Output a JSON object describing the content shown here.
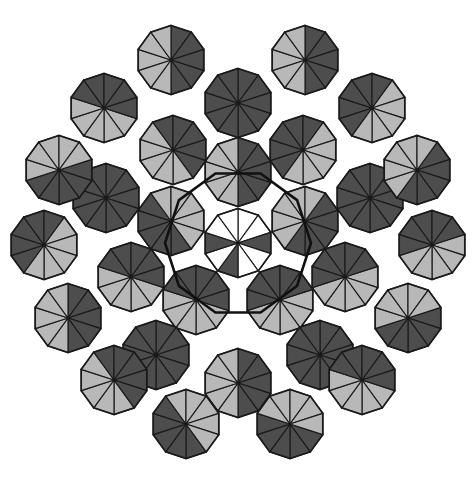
{
  "figure": {
    "caption": "",
    "width": 476,
    "height": 482,
    "background_color": "#ffffff"
  },
  "palette": {
    "dark": "#4d4d4d",
    "light": "#b8b8b8",
    "white": "#ffffff",
    "stroke": "#1a1a1a",
    "heavy_stroke": "#111111"
  },
  "geometry": {
    "center_x": 238,
    "center_y": 243,
    "decagon_radius": 34.5,
    "symmetry_order": 10,
    "stroke_width": 1.15,
    "heavy_stroke_width": 2.6,
    "pattern_bounds": {
      "left": 14,
      "top": 22,
      "right": 462,
      "bottom": 466
    },
    "central_hub_radius": 73
  },
  "chart_data": {
    "type": "scatter",
    "xlabel": "",
    "ylabel": "",
    "decagons": [
      {
        "cx": 238,
        "cy": 243,
        "ring": 0,
        "pattern": "center",
        "rot": 0
      },
      {
        "cx": 238,
        "cy": 172,
        "ring": 1,
        "pattern": "halfDarkTop",
        "rot": 0
      },
      {
        "cx": 305,
        "cy": 221,
        "ring": 1,
        "pattern": "halfDarkTop",
        "rot": 36
      },
      {
        "cx": 280,
        "cy": 300,
        "ring": 1,
        "pattern": "halfLightTop",
        "rot": 72
      },
      {
        "cx": 196,
        "cy": 300,
        "ring": 1,
        "pattern": "halfLightTop",
        "rot": 108
      },
      {
        "cx": 171,
        "cy": 221,
        "ring": 1,
        "pattern": "halfDarkTop",
        "rot": 144
      },
      {
        "cx": 238,
        "cy": 103,
        "ring": 2,
        "pattern": "allDark",
        "rot": 0
      },
      {
        "cx": 303,
        "cy": 150,
        "ring": 2,
        "pattern": "halfLightTop",
        "rot": 36
      },
      {
        "cx": 370,
        "cy": 198,
        "ring": 2,
        "pattern": "allDark",
        "rot": 0
      },
      {
        "cx": 345,
        "cy": 277,
        "ring": 2,
        "pattern": "halfLightTop",
        "rot": 72
      },
      {
        "cx": 320,
        "cy": 355,
        "ring": 2,
        "pattern": "allDark",
        "rot": 0
      },
      {
        "cx": 238,
        "cy": 383,
        "ring": 2,
        "pattern": "halfDarkTop",
        "rot": 0
      },
      {
        "cx": 156,
        "cy": 355,
        "ring": 2,
        "pattern": "allDark",
        "rot": 0
      },
      {
        "cx": 131,
        "cy": 277,
        "ring": 2,
        "pattern": "halfLightTop",
        "rot": 108
      },
      {
        "cx": 106,
        "cy": 198,
        "ring": 2,
        "pattern": "allDark",
        "rot": 0
      },
      {
        "cx": 173,
        "cy": 150,
        "ring": 2,
        "pattern": "halfLightTop",
        "rot": 144
      },
      {
        "cx": 171,
        "cy": 60,
        "ring": 3,
        "pattern": "halfDarkTop",
        "rot": 0
      },
      {
        "cx": 305,
        "cy": 60,
        "ring": 3,
        "pattern": "halfDarkTop",
        "rot": 0
      },
      {
        "cx": 372,
        "cy": 108,
        "ring": 3,
        "pattern": "halfLightTop",
        "rot": 36
      },
      {
        "cx": 417,
        "cy": 170,
        "ring": 3,
        "pattern": "halfDarkTop",
        "rot": 36
      },
      {
        "cx": 432,
        "cy": 245,
        "ring": 3,
        "pattern": "halfLightTop",
        "rot": 72
      },
      {
        "cx": 408,
        "cy": 318,
        "ring": 3,
        "pattern": "halfDarkTop",
        "rot": 72
      },
      {
        "cx": 362,
        "cy": 380,
        "ring": 3,
        "pattern": "halfLightTop",
        "rot": 108
      },
      {
        "cx": 290,
        "cy": 424,
        "ring": 3,
        "pattern": "halfDarkTop",
        "rot": 108
      },
      {
        "cx": 186,
        "cy": 424,
        "ring": 3,
        "pattern": "halfDarkTop",
        "rot": 144
      },
      {
        "cx": 114,
        "cy": 380,
        "ring": 3,
        "pattern": "halfLightTop",
        "rot": 144
      },
      {
        "cx": 68,
        "cy": 318,
        "ring": 3,
        "pattern": "halfDarkTop",
        "rot": 0
      },
      {
        "cx": 44,
        "cy": 245,
        "ring": 3,
        "pattern": "halfLightTop",
        "rot": 36
      },
      {
        "cx": 59,
        "cy": 170,
        "ring": 3,
        "pattern": "halfDarkTop",
        "rot": 72
      },
      {
        "cx": 104,
        "cy": 108,
        "ring": 3,
        "pattern": "halfLightTop",
        "rot": 108
      }
    ],
    "shade_patterns": {
      "allDark": [
        "d",
        "d",
        "d",
        "d",
        "d",
        "d",
        "d",
        "d",
        "d",
        "d"
      ],
      "halfDarkTop": [
        "d",
        "d",
        "d",
        "d",
        "d",
        "l",
        "l",
        "l",
        "l",
        "l"
      ],
      "halfLightTop": [
        "l",
        "l",
        "l",
        "l",
        "l",
        "d",
        "d",
        "d",
        "d",
        "d"
      ],
      "center": [
        "w",
        "w",
        "d",
        "w",
        "w",
        "d",
        "w",
        "d",
        "w",
        "w"
      ]
    }
  }
}
